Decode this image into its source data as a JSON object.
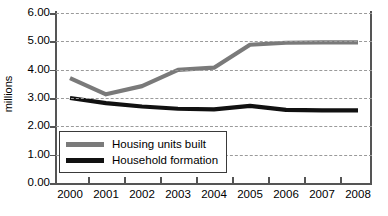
{
  "chart_data": {
    "type": "line",
    "title": "",
    "xlabel": "",
    "ylabel": "millions",
    "categories": [
      "2000",
      "2001",
      "2002",
      "2003",
      "2004",
      "2005",
      "2006",
      "2007",
      "2008"
    ],
    "x": [
      2000,
      2001,
      2002,
      2003,
      2004,
      2005,
      2006,
      2007,
      2008
    ],
    "ylim": [
      0.0,
      6.0
    ],
    "yticks": [
      "0.00",
      "1.00",
      "2.00",
      "3.00",
      "4.00",
      "5.00",
      "6.00"
    ],
    "ytick_values": [
      0.0,
      1.0,
      2.0,
      3.0,
      4.0,
      5.0,
      6.0
    ],
    "grid": true,
    "grid_style": "dashed-horizontal",
    "legend_position": "inside-lower-left",
    "series": [
      {
        "name": "Housing units built",
        "color": "#7a7a7a",
        "values": [
          3.7,
          3.13,
          3.42,
          3.99,
          4.07,
          4.88,
          4.95,
          4.96,
          4.96
        ]
      },
      {
        "name": "Household formation",
        "color": "#111111",
        "values": [
          3.0,
          2.82,
          2.7,
          2.62,
          2.6,
          2.72,
          2.58,
          2.56,
          2.56
        ]
      }
    ]
  },
  "legend": {
    "items": [
      {
        "label": "Housing units built",
        "color": "#7a7a7a"
      },
      {
        "label": "Household formation",
        "color": "#111111"
      }
    ]
  },
  "axes": {
    "y_label": "millions"
  }
}
